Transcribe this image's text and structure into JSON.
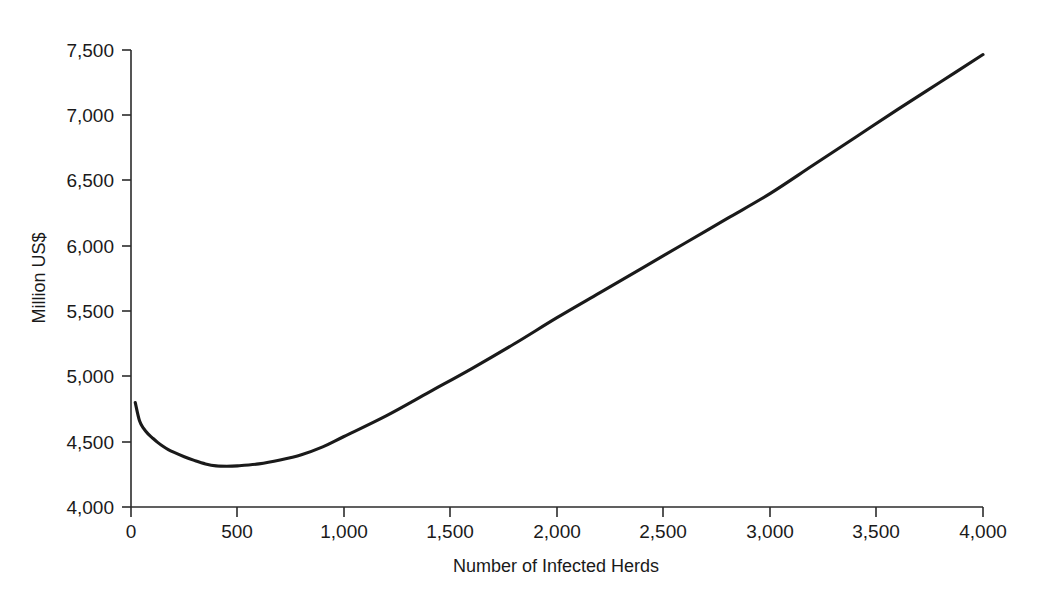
{
  "chart_data": {
    "type": "line",
    "title": "",
    "subtitle": "",
    "xlabel": "Number of Infected Herds",
    "ylabel": "Million US$",
    "xlim": [
      0,
      4000
    ],
    "ylim": [
      4000,
      7500
    ],
    "xticks": [
      0,
      500,
      1000,
      1500,
      2000,
      2500,
      3000,
      3500,
      4000
    ],
    "xtick_labels": [
      "0",
      "500",
      "1,000",
      "1,500",
      "2,000",
      "2,500",
      "3,000",
      "3,500",
      "4,000"
    ],
    "yticks": [
      4000,
      4500,
      5000,
      5500,
      6000,
      6500,
      7000,
      7500
    ],
    "ytick_labels": [
      "4,000",
      "4,500",
      "5,000",
      "5,500",
      "6,000",
      "6,500",
      "7,000",
      "7,500"
    ],
    "grid": false,
    "legend": null,
    "legend_position": "none",
    "line_color": "#1a1a1a",
    "series": [
      {
        "name": "Total cost",
        "x": [
          20,
          40,
          60,
          80,
          100,
          125,
          150,
          175,
          200,
          250,
          300,
          350,
          400,
          450,
          500,
          600,
          700,
          800,
          900,
          1000,
          1200,
          1400,
          1600,
          1800,
          2000,
          2200,
          2400,
          2600,
          2800,
          3000,
          3200,
          3400,
          3600,
          3800,
          4000
        ],
        "values": [
          4800,
          4660,
          4600,
          4560,
          4530,
          4495,
          4465,
          4440,
          4420,
          4385,
          4355,
          4330,
          4315,
          4312,
          4315,
          4330,
          4360,
          4400,
          4460,
          4540,
          4700,
          4880,
          5060,
          5250,
          5450,
          5640,
          5830,
          6020,
          6210,
          6400,
          6615,
          6830,
          7045,
          7255,
          7465
        ]
      }
    ],
    "annotations": [],
    "minimum_point": {
      "x": 420,
      "y": 4312
    }
  }
}
